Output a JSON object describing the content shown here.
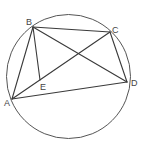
{
  "diagram": {
    "type": "geometry",
    "circle": {
      "cx": 68.5,
      "cy": 76.5,
      "r": 62
    },
    "points": {
      "A": {
        "x": 12,
        "y": 99,
        "label": "A",
        "lx": 4,
        "ly": 106
      },
      "B": {
        "x": 33,
        "y": 27,
        "label": "B",
        "lx": 26,
        "ly": 25
      },
      "C": {
        "x": 110,
        "y": 32,
        "label": "C",
        "lx": 112,
        "ly": 33
      },
      "D": {
        "x": 127,
        "y": 82,
        "label": "D",
        "lx": 131,
        "ly": 86
      },
      "E": {
        "x": 40,
        "y": 80,
        "label": "E",
        "lx": 40,
        "ly": 90
      }
    },
    "segments": [
      [
        "A",
        "B"
      ],
      [
        "B",
        "C"
      ],
      [
        "C",
        "D"
      ],
      [
        "D",
        "A"
      ],
      [
        "B",
        "D"
      ],
      [
        "A",
        "C"
      ],
      [
        "B",
        "E"
      ]
    ]
  }
}
